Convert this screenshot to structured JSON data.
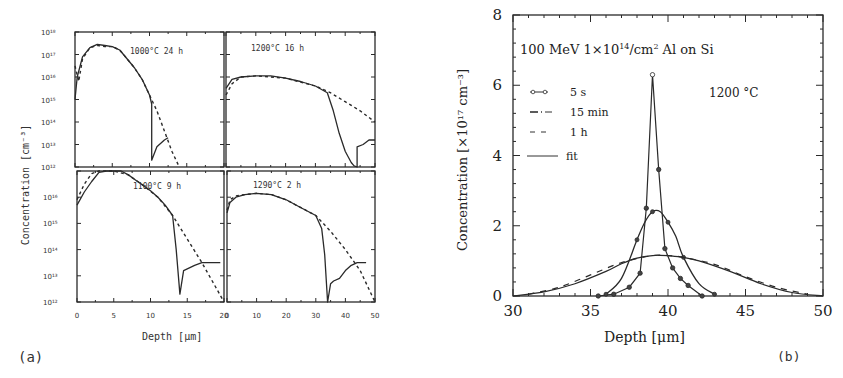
{
  "chart_data": [
    {
      "panel": "(a)",
      "type": "line",
      "xlabel": "Depth [μm]",
      "ylabel": "Concentration [cm⁻³]",
      "yscale": "log",
      "subplots": [
        {
          "annotation": "1000°C 24 h",
          "xlim": [
            0,
            20
          ],
          "ylim": [
            1000000000000.0,
            1e+18
          ],
          "yticks": [
            "10¹²",
            "10¹³",
            "10¹⁴",
            "10¹⁵",
            "10¹⁶",
            "10¹⁷",
            "10¹⁸"
          ],
          "series": [
            {
              "name": "measured",
              "style": "solid",
              "x": [
                0,
                0.3,
                1,
                2,
                3,
                4,
                5,
                6,
                7,
                8,
                9,
                10,
                10.3,
                10.3,
                11,
                12,
                12.5
              ],
              "logy": [
                15,
                16,
                16.9,
                17.3,
                17.45,
                17.4,
                17.35,
                17.2,
                16.8,
                16.4,
                15.9,
                15.2,
                14.8,
                12.3,
                12.9,
                13.2,
                13.3
              ]
            },
            {
              "name": "simulated",
              "style": "dashed",
              "x": [
                0,
                0.5,
                1,
                2,
                3,
                4,
                5,
                6,
                7,
                8,
                9,
                10,
                11,
                12,
                13,
                14
              ],
              "logy": [
                16.5,
                15.8,
                16.8,
                17.3,
                17.4,
                17.35,
                17.35,
                17.2,
                16.8,
                16.4,
                15.9,
                15.2,
                14.5,
                13.6,
                12.7,
                12
              ]
            }
          ]
        },
        {
          "annotation": "1200°C 16 h",
          "xlim": [
            0,
            50
          ],
          "ylim": [
            1000000000000.0,
            1e+18
          ],
          "series": [
            {
              "name": "measured",
              "style": "solid",
              "x": [
                0,
                2,
                5,
                10,
                15,
                20,
                25,
                30,
                34,
                36,
                38,
                40,
                42,
                43,
                44,
                44,
                46,
                48,
                50
              ],
              "logy": [
                15.5,
                15.9,
                16.0,
                16.05,
                16.05,
                15.95,
                15.8,
                15.6,
                15.3,
                14.5,
                13.5,
                12.7,
                12.2,
                12.05,
                12.0,
                12.9,
                13.0,
                13.2,
                13.2
              ]
            },
            {
              "name": "simulated",
              "style": "dashed",
              "x": [
                0,
                2,
                5,
                10,
                20,
                30,
                35,
                40,
                45,
                50
              ],
              "logy": [
                15.2,
                15.7,
                16.0,
                16.05,
                15.95,
                15.6,
                15.3,
                14.9,
                14.5,
                14.0
              ]
            }
          ]
        },
        {
          "annotation": "1100°C 9 h",
          "xlim": [
            0,
            20
          ],
          "ylim": [
            1000000000000.0,
            1e+17
          ],
          "yticks": [
            "10¹²",
            "10¹³",
            "10¹⁴",
            "10¹⁵",
            "10¹⁶",
            "10¹⁷"
          ],
          "series": [
            {
              "name": "measured",
              "style": "solid",
              "x": [
                0,
                1,
                2,
                3,
                4,
                5,
                6,
                7,
                8,
                9,
                10,
                11,
                12,
                13,
                13.5,
                14,
                14.5,
                16,
                17,
                18,
                19.5
              ],
              "logy": [
                15.7,
                16.2,
                16.6,
                16.95,
                17.0,
                17.05,
                17.0,
                16.85,
                16.65,
                16.45,
                16.25,
                16.0,
                15.7,
                15.3,
                14.0,
                12.3,
                13.2,
                13.4,
                13.5,
                13.5,
                13.5
              ]
            },
            {
              "name": "simulated",
              "style": "dashed",
              "x": [
                0,
                1,
                2,
                3,
                5,
                7,
                9,
                11,
                13,
                15,
                17,
                19,
                20
              ],
              "logy": [
                15.9,
                16.5,
                16.9,
                17.0,
                17.05,
                16.85,
                16.45,
                16.0,
                15.3,
                14.4,
                13.5,
                12.5,
                12.0
              ]
            }
          ]
        },
        {
          "annotation": "1290°C 2 h",
          "xlim": [
            0,
            50
          ],
          "ylim": [
            1000000000000.0,
            1e+17
          ],
          "series": [
            {
              "name": "measured",
              "style": "solid",
              "x": [
                0,
                1,
                3,
                6,
                10,
                15,
                20,
                25,
                30,
                32,
                33,
                34,
                34,
                35,
                36,
                38,
                40,
                42,
                44,
                47
              ],
              "logy": [
                15.4,
                15.8,
                16.0,
                16.1,
                16.15,
                16.1,
                15.9,
                15.6,
                15.3,
                14.8,
                13.8,
                12.0,
                12.0,
                12.7,
                12.8,
                12.9,
                13.2,
                13.4,
                13.5,
                13.5
              ]
            },
            {
              "name": "simulated",
              "style": "dashed",
              "x": [
                0,
                1,
                3,
                6,
                10,
                15,
                20,
                25,
                30,
                35,
                40,
                45,
                50
              ],
              "logy": [
                15.5,
                15.9,
                16.05,
                16.1,
                16.15,
                16.1,
                15.9,
                15.6,
                15.3,
                14.7,
                14.0,
                13.2,
                12.0
              ]
            }
          ]
        }
      ],
      "xticks_left": [
        0,
        5,
        10,
        15,
        20
      ],
      "xticks_right": [
        0,
        10,
        20,
        30,
        40,
        50
      ]
    },
    {
      "panel": "(b)",
      "type": "line",
      "title": "100 MeV 1×10¹⁴/cm² Al on Si",
      "annotation": "1200 °C",
      "xlabel": "Depth [μm]",
      "ylabel": "Concentration [×10¹⁷ cm⁻³]",
      "xlim": [
        30,
        50
      ],
      "ylim": [
        0,
        8
      ],
      "xticks": [
        30,
        35,
        40,
        45,
        50
      ],
      "yticks": [
        0,
        2,
        4,
        6,
        8
      ],
      "legend": [
        "5 s",
        "15 min",
        "1 h",
        "fit"
      ],
      "series": [
        {
          "name": "5 s",
          "style": "line+circles",
          "x": [
            35.5,
            36.5,
            37.5,
            38.2,
            38.6,
            39.0,
            39.4,
            39.8,
            40.3,
            40.8,
            41.3,
            42.2
          ],
          "y": [
            0.0,
            0.05,
            0.25,
            0.65,
            2.5,
            6.3,
            3.6,
            1.35,
            0.8,
            0.5,
            0.3,
            0.0
          ]
        },
        {
          "name": "15 min",
          "style": "dash-dot",
          "x": [
            36.0,
            37.0,
            38.0,
            38.5,
            39.0,
            39.5,
            40.0,
            40.5,
            41.0,
            42.0,
            43.0
          ],
          "y": [
            0.05,
            0.5,
            1.6,
            2.1,
            2.4,
            2.4,
            2.1,
            1.7,
            1.1,
            0.35,
            0.05
          ]
        },
        {
          "name": "1 h",
          "style": "dashed",
          "x": [
            31,
            33,
            35,
            37,
            39,
            40,
            41,
            43,
            45,
            47,
            49
          ],
          "y": [
            0.05,
            0.25,
            0.6,
            0.95,
            1.15,
            1.15,
            1.1,
            0.9,
            0.55,
            0.25,
            0.05
          ]
        },
        {
          "name": "fit",
          "style": "solid",
          "x": [
            30,
            32,
            34,
            36,
            37,
            38,
            39,
            39.5,
            40,
            41,
            42,
            44,
            46,
            48,
            50
          ],
          "y": [
            0.0,
            0.12,
            0.35,
            0.7,
            0.92,
            1.08,
            1.15,
            1.16,
            1.15,
            1.1,
            1.0,
            0.7,
            0.35,
            0.1,
            0.0
          ]
        }
      ]
    }
  ],
  "labels": {
    "panel_a": "(a)",
    "panel_b": "(b)",
    "a_ylabel": "Concentration  [cm⁻³]",
    "a_xlabel": "Depth [μm]",
    "b_ylabel": "Concentration [×10¹⁷ cm⁻³]",
    "b_xlabel": "Depth [μm]",
    "b_title": "100 MeV 1×10¹⁴/cm² Al on Si",
    "b_temp": "1200 °C",
    "sub1": "1000°C  24 h",
    "sub2": "1200°C  16 h",
    "sub3": "1100°C  9 h",
    "sub4": "1290°C  2 h",
    "leg1": "5 s",
    "leg2": "15 min",
    "leg3": "1 h",
    "leg4": "fit"
  }
}
